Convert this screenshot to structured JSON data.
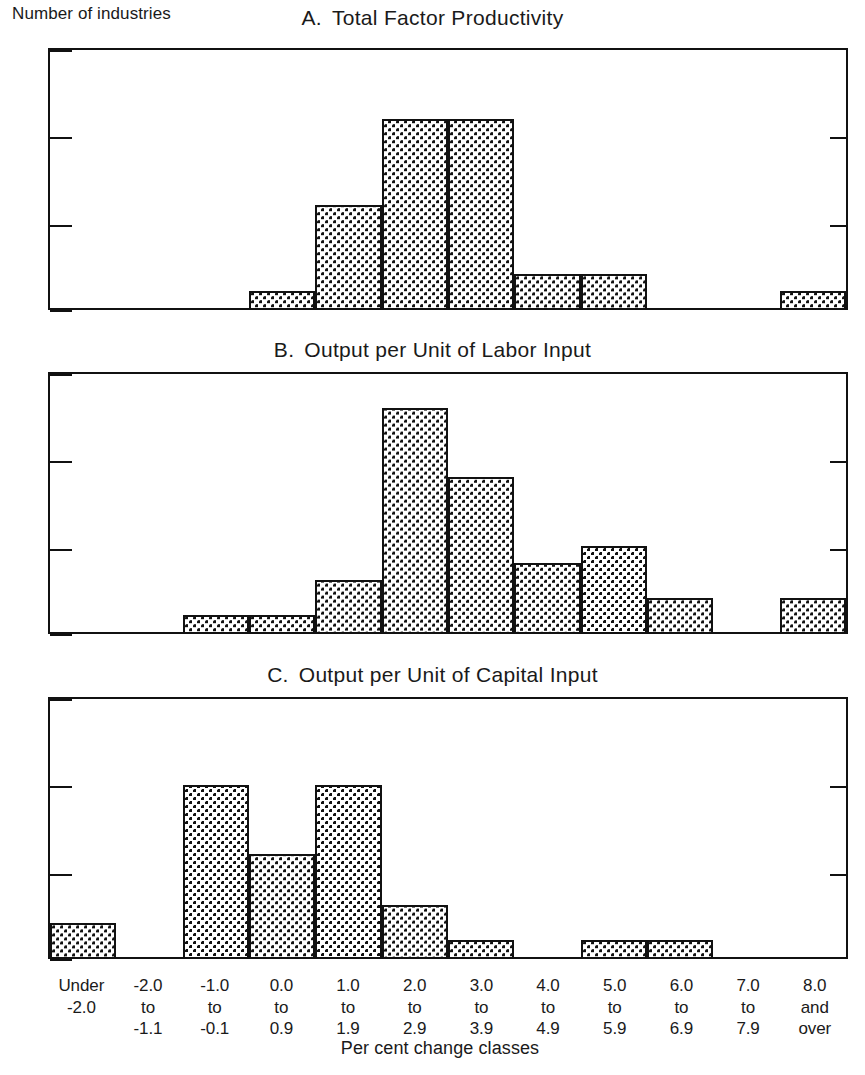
{
  "figure": {
    "y_axis_label": "Number of industries",
    "x_axis_label": "Per cent change classes"
  },
  "chart_data": {
    "type": "bar",
    "title": "",
    "xlabel": "Per cent change classes",
    "ylabel": "Number of industries",
    "ylim": [
      0,
      15
    ],
    "yticks": [
      0,
      5,
      10,
      15
    ],
    "grid": false,
    "legend": null,
    "categories": [
      "Under\n-2.0",
      "-2.0\nto\n-1.1",
      "-1.0\nto\n-0.1",
      "0.0\nto\n0.9",
      "1.0\nto\n1.9",
      "2.0\nto\n2.9",
      "3.0\nto\n3.9",
      "4.0\nto\n4.9",
      "5.0\nto\n5.9",
      "6.0\nto\n6.9",
      "7.0\nto\n7.9",
      "8.0\nand\nover"
    ],
    "panels": [
      {
        "letter": "A.",
        "title": "Total Factor Productivity",
        "values": [
          0,
          0,
          0,
          1,
          6,
          11,
          11,
          2,
          2,
          0,
          0,
          1
        ]
      },
      {
        "letter": "B.",
        "title": "Output per Unit of Labor Input",
        "values": [
          0,
          0,
          1,
          1,
          3,
          13,
          9,
          4,
          5,
          2,
          0,
          2
        ]
      },
      {
        "letter": "C.",
        "title": "Output per Unit of Capital Input",
        "values": [
          2,
          0,
          10,
          6,
          10,
          3,
          1,
          0,
          1,
          1,
          0,
          0
        ]
      }
    ]
  }
}
